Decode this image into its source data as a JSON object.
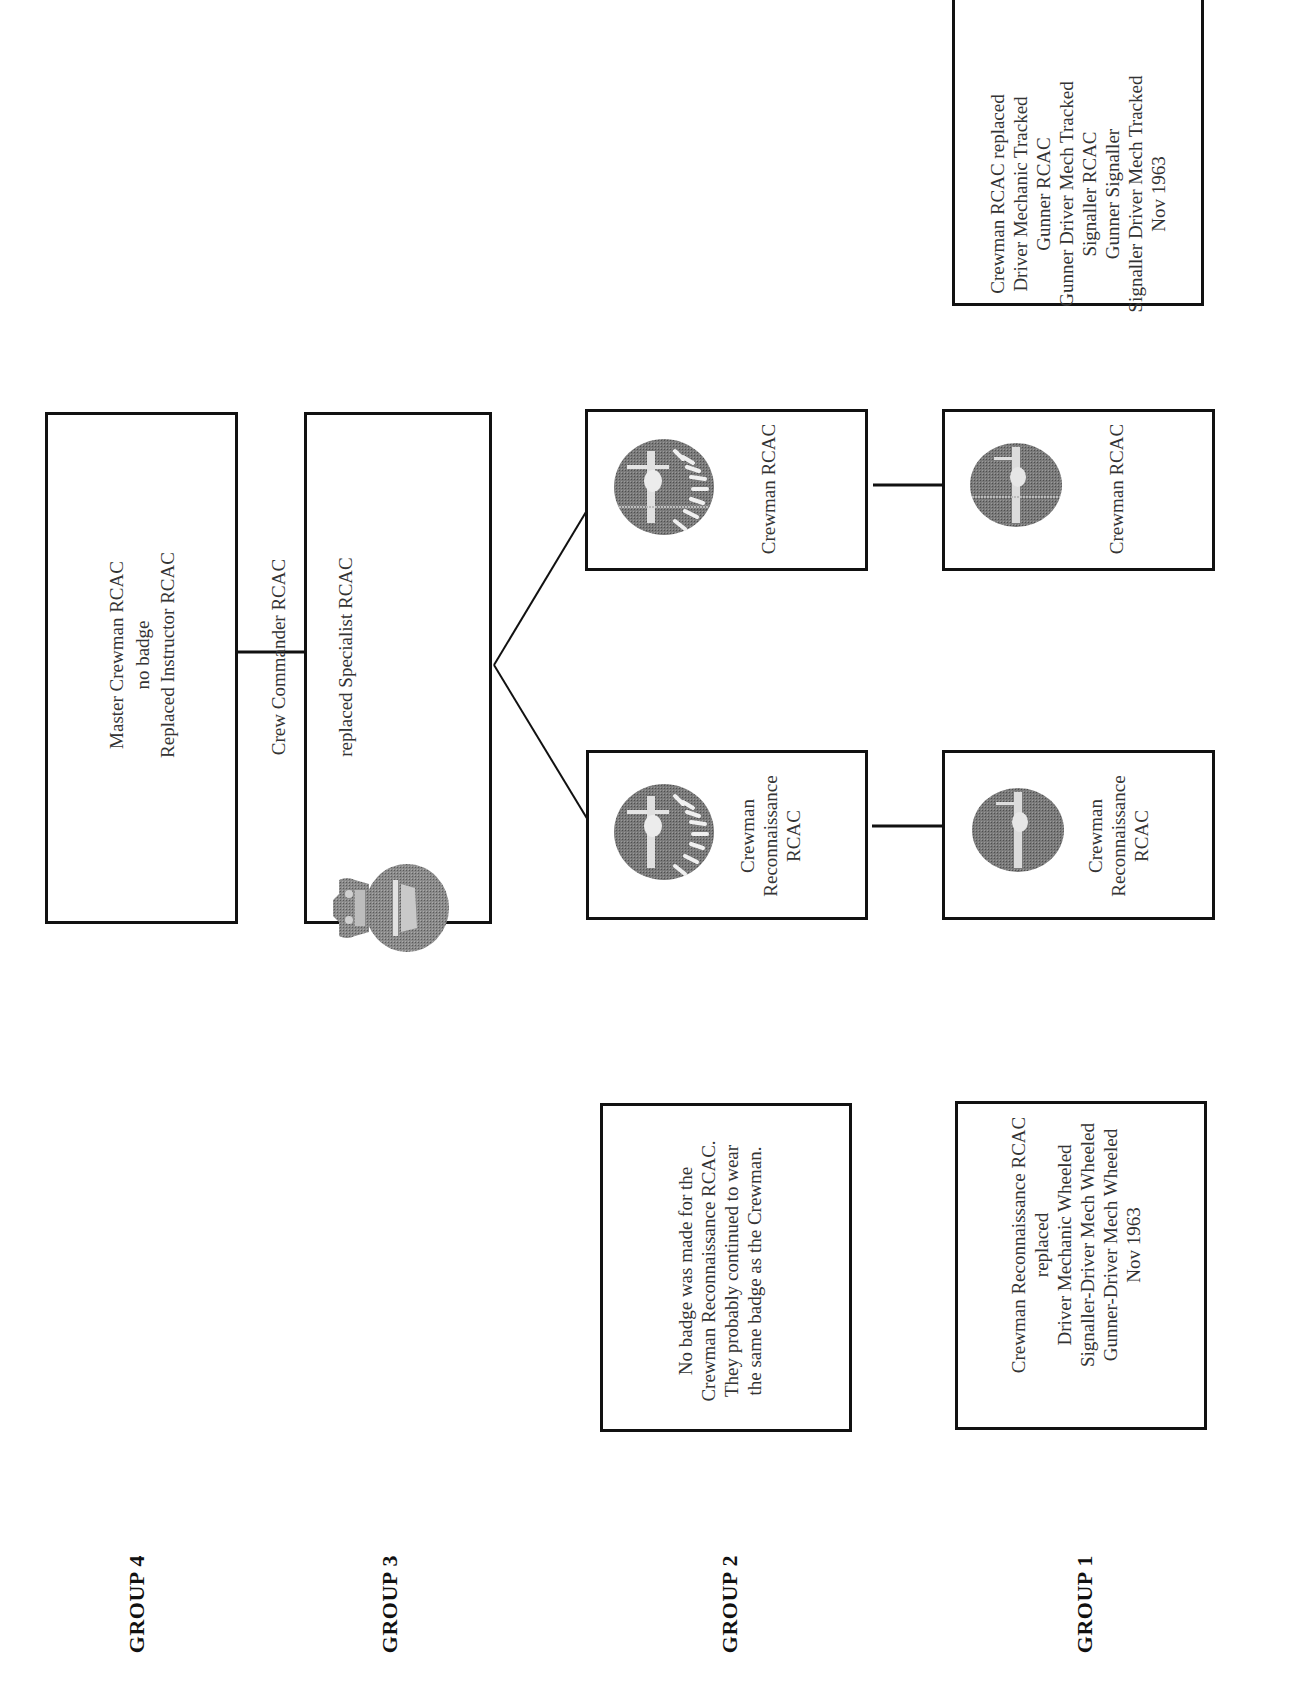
{
  "groups": {
    "group4": {
      "label": "GROUP 4",
      "box": {
        "line1": "Master Crewman RCAC",
        "line2": "no badge",
        "line3": "Replaced Instructor RCAC"
      }
    },
    "group3": {
      "label": "GROUP 3",
      "box": {
        "line1": "Crew Commander RCAC",
        "line2": "replaced Specialist RCAC",
        "badge": "crown-tank-badge"
      }
    },
    "group2": {
      "label": "GROUP 2",
      "crewman": {
        "title": "Crewman RCAC",
        "badge": "tank-laurel-badge"
      },
      "recce": {
        "line1": "Crewman",
        "line2": "Reconnaissance",
        "line3": "RCAC",
        "badge": "tank-laurel-badge"
      },
      "note": {
        "lines": [
          "No badge was made for the",
          "Crewman Reconnaissance RCAC.",
          "They probably continued to wear",
          "the same badge as the Crewman."
        ]
      }
    },
    "group1": {
      "label": "GROUP 1",
      "crewman": {
        "title": "Crewman RCAC",
        "badge": "tank-badge"
      },
      "recce": {
        "line1": "Crewman",
        "line2": "Reconnaissance",
        "line3": "RCAC",
        "badge": "tank-badge"
      },
      "note": {
        "lines": [
          "Crewman Reconnaissance RCAC",
          "replaced",
          "Driver Mechanic Wheeled",
          "Signaller-Driver Mech Wheeled",
          "Gunner-Driver Mech Wheeled",
          "Nov 1963"
        ]
      },
      "tracked_note": {
        "lines": [
          "Crewman RCAC replaced",
          "Driver Mechanic Tracked",
          "Gunner RCAC",
          "Gunner Driver Mech Tracked",
          "Signaller RCAC",
          "Gunner Signaller",
          "Signaller Driver Mech Tracked",
          "Nov 1963"
        ]
      }
    }
  },
  "colors": {
    "border": "#111111",
    "text": "#333333",
    "badge_dark": "#6e6e6e",
    "badge_light": "#d9d9d9"
  }
}
